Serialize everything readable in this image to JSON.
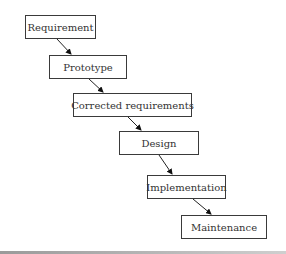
{
  "diagram": {
    "type": "waterfall-process",
    "steps": [
      {
        "label": "Requirement"
      },
      {
        "label": "Prototype"
      },
      {
        "label": "Corrected requirements"
      },
      {
        "label": "Design"
      },
      {
        "label": "Implementation"
      },
      {
        "label": "Maintenance"
      }
    ],
    "edges": [
      {
        "from": "Requirement",
        "to": "Prototype"
      },
      {
        "from": "Prototype",
        "to": "Corrected requirements"
      },
      {
        "from": "Corrected requirements",
        "to": "Design"
      },
      {
        "from": "Design",
        "to": "Implementation"
      },
      {
        "from": "Implementation",
        "to": "Maintenance"
      }
    ]
  }
}
